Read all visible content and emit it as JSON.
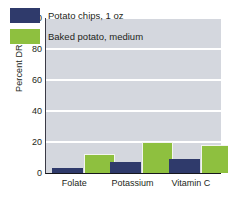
{
  "chart_data": {
    "type": "bar",
    "title": "",
    "xlabel": "",
    "ylabel": "Percent DRI*",
    "ylim": [
      0,
      100
    ],
    "yticks": [
      0,
      20,
      40,
      60,
      80,
      100
    ],
    "ytick_labels": [
      "0",
      "20",
      "40",
      "60",
      "80",
      "100"
    ],
    "grid": true,
    "legend_position": "top-left",
    "categories": [
      "Folate",
      "Potassium",
      "Vitamin C"
    ],
    "series": [
      {
        "name": "Potato chips, 1 oz",
        "color": "#2f3a6b",
        "values": [
          3,
          7,
          9
        ]
      },
      {
        "name": "Baked potato, medium",
        "color": "#8ec03f",
        "values": [
          12,
          20,
          18
        ]
      }
    ],
    "plot_background": "#d4d7de",
    "gridline_color": "#ffffff",
    "axis_color": "#16161c"
  }
}
